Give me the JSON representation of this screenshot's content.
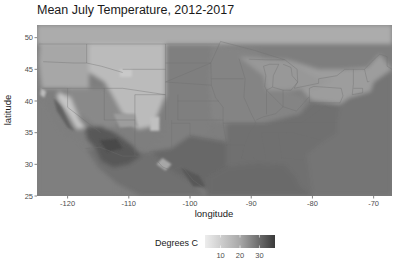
{
  "chart_data": {
    "type": "heatmap",
    "title": "Mean July Temperature, 2012-2017",
    "xlabel": "longitude",
    "ylabel": "latitude",
    "xlim": [
      -125,
      -67
    ],
    "ylim": [
      25,
      52
    ],
    "x_ticks": [
      -120,
      -110,
      -100,
      -90,
      -80,
      -70
    ],
    "y_ticks": [
      25,
      30,
      35,
      40,
      45,
      50
    ],
    "x_tick_labels": [
      "-120",
      "-110",
      "-100",
      "-90",
      "-80",
      "-70"
    ],
    "y_tick_labels": [
      "25",
      "30",
      "35",
      "40",
      "45",
      "50"
    ],
    "grid": false,
    "colorscale": {
      "name": "Degrees C",
      "low_color": "#ececec",
      "high_color": "#3a3a3a",
      "range": [
        2,
        38
      ],
      "ticks": [
        10,
        20,
        30
      ],
      "tick_labels": [
        "10",
        "20",
        "30"
      ]
    },
    "legend_position": "bottom",
    "regions": [
      {
        "name": "Pacific Ocean",
        "value": 24
      },
      {
        "name": "Gulf of Mexico",
        "value": 28
      },
      {
        "name": "Atlantic Ocean",
        "value": 26
      },
      {
        "name": "Canada (south)",
        "value": 15
      },
      {
        "name": "Pacific Northwest",
        "value": 16
      },
      {
        "name": "Rocky Mountains",
        "value": 12
      },
      {
        "name": "Great Basin",
        "value": 22
      },
      {
        "name": "Southwest Desert",
        "value": 32
      },
      {
        "name": "Sierra Nevada",
        "value": 10
      },
      {
        "name": "Great Plains",
        "value": 24
      },
      {
        "name": "Midwest",
        "value": 23
      },
      {
        "name": "Great Lakes",
        "value": 19
      },
      {
        "name": "Northeast",
        "value": 18
      },
      {
        "name": "Southeast",
        "value": 27
      },
      {
        "name": "Texas",
        "value": 29
      },
      {
        "name": "Mexico (north)",
        "value": 27
      }
    ]
  }
}
